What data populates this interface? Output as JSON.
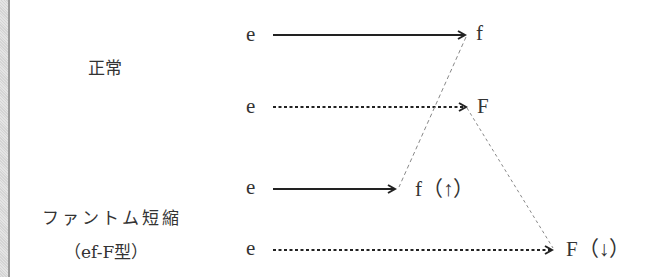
{
  "diagram": {
    "labels": {
      "normal": "正常",
      "phantom": "ファントム短縮",
      "phantom_type": "（ef-F型）"
    },
    "rows": [
      {
        "source": "e",
        "target": "f",
        "line": "solid"
      },
      {
        "source": "e",
        "target": "F",
        "line": "dotted"
      },
      {
        "source": "e",
        "target": "f（↑）",
        "line": "solid"
      },
      {
        "source": "e",
        "target": "F（↓）",
        "line": "dotted"
      }
    ],
    "connectors": [
      {
        "from": "f",
        "to": "f（↑）",
        "style": "dashed"
      },
      {
        "from": "F",
        "to": "F（↓）",
        "style": "dashed"
      }
    ],
    "colors": {
      "ink": "#333333",
      "connector": "#888888"
    }
  }
}
